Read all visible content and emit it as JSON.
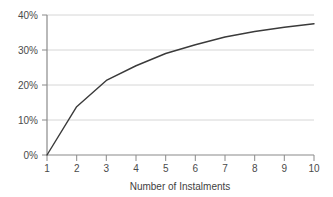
{
  "chart_data": {
    "type": "line",
    "title": "",
    "xlabel": "Number of Instalments",
    "ylabel": "",
    "x": [
      1,
      2,
      3,
      4,
      5,
      6,
      7,
      8,
      9,
      10
    ],
    "values": [
      0.0,
      13.8,
      21.3,
      25.5,
      29.0,
      31.5,
      33.7,
      35.3,
      36.5,
      37.5
    ],
    "series": [
      {
        "name": "",
        "values": [
          0.0,
          13.8,
          21.3,
          25.5,
          29.0,
          31.5,
          33.7,
          35.3,
          36.5,
          37.5
        ]
      }
    ],
    "xtick_labels": [
      "1",
      "2",
      "3",
      "4",
      "5",
      "6",
      "7",
      "8",
      "9",
      "10"
    ],
    "ytick_labels": [
      "0%",
      "10%",
      "20%",
      "30%",
      "40%"
    ],
    "ytick_values": [
      0,
      10,
      20,
      30,
      40
    ],
    "xlim": [
      1,
      10
    ],
    "ylim": [
      0,
      40
    ],
    "grid": "horizontal",
    "legend": "none",
    "line_color": "#3a3a3a",
    "grid_color": "#d6d6d6",
    "axis_color": "#8a8a8a",
    "background_color": "#ffffff"
  }
}
